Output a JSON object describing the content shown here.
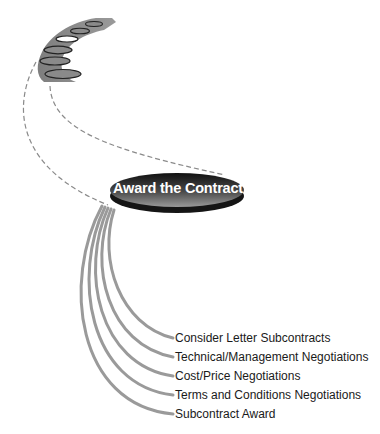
{
  "diagram": {
    "central_node": {
      "label": "Award the Contract",
      "fill_dark": "#1a1a1a",
      "fill_light": "#6a6a6a"
    },
    "process_band": {
      "fill": "#8c8c8c",
      "stage_count": 6,
      "highlighted_stage_index": 3,
      "highlight_color": "#ffffff"
    },
    "connector_color": "#999999",
    "dashed_color": "#8a8a8a",
    "steps": [
      {
        "label": "Consider Letter Subcontracts"
      },
      {
        "label": "Technical/Management Negotiations"
      },
      {
        "label": "Cost/Price Negotiations"
      },
      {
        "label": "Terms and Conditions Negotiations"
      },
      {
        "label": "Subcontract Award"
      }
    ]
  }
}
